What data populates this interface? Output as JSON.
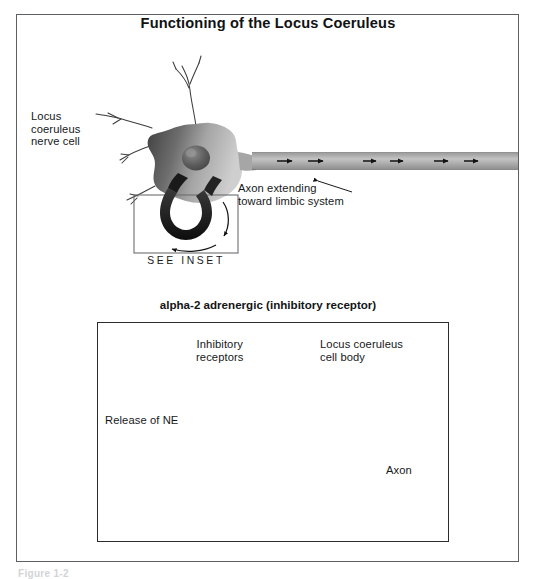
{
  "figure": {
    "title": "Functioning of the Locus Coeruleus",
    "caption": "Figure 1-2",
    "frame_color": "#5c5f63",
    "background": "#ffffff"
  },
  "main_diagram": {
    "labels": {
      "nerve_cell": "Locus\ncoeruleus\nnerve cell",
      "axon_extending": "Axon extending\ntoward limbic system",
      "see_inset": "SEE INSET"
    },
    "axon": {
      "arrow_count": 6,
      "direction": "rightward",
      "fill_color": "#a8a8a8"
    },
    "soma": {
      "fill_dark": "#4a4a4a",
      "fill_light": "#c9c9c9",
      "nucleus_color": "#5a5a5a"
    },
    "dendrite_count": 5,
    "hairpin_loop_color": "#1b1b1b"
  },
  "inset": {
    "title": "alpha-2 adrenergic (inhibitory receptor)",
    "border_color": "#2a2c2e",
    "labels": {
      "inhibitory_receptors": "Inhibitory\nreceptors",
      "locus_coeruleus_cell_body": "Locus coeruleus\ncell body",
      "release_of_ne": "Release of NE",
      "axon": "Axon"
    },
    "receptors": {
      "count": 4,
      "ring_color": "#1d1d1d",
      "center_color": "#b9b9b9"
    },
    "release_arrow_count": 4,
    "vesicle_count": 13,
    "cell_body_fill": "#d8d8d8",
    "axon_fill": "#8d8d8d",
    "axon_flow_arrows": 2
  }
}
